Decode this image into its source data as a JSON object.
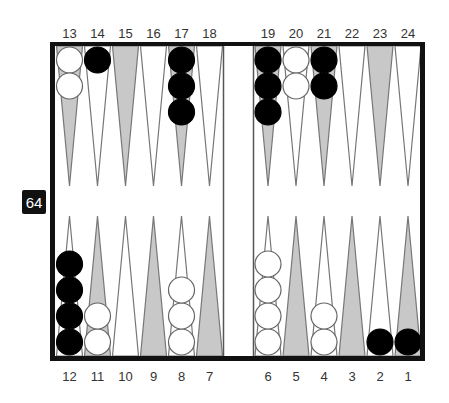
{
  "board": {
    "top_labels": [
      "13",
      "14",
      "15",
      "16",
      "17",
      "18",
      "19",
      "20",
      "21",
      "22",
      "23",
      "24"
    ],
    "bottom_labels": [
      "12",
      "11",
      "10",
      "9",
      "8",
      "7",
      "6",
      "5",
      "4",
      "3",
      "2",
      "1"
    ],
    "cube": {
      "value": "64",
      "position": "left-center"
    },
    "colors": {
      "frame": "#111111",
      "point_outline": "#777777",
      "shaded_point": "#c8c8c8",
      "light_point": "#ffffff",
      "black_checker": "#000000",
      "white_checker": "#ffffff",
      "cube_bg": "#111111"
    },
    "points": [
      {
        "point": 1,
        "color": "black",
        "count": 1
      },
      {
        "point": 2,
        "color": "black",
        "count": 1
      },
      {
        "point": 3,
        "color": null,
        "count": 0
      },
      {
        "point": 4,
        "color": "white",
        "count": 2
      },
      {
        "point": 5,
        "color": null,
        "count": 0
      },
      {
        "point": 6,
        "color": "white",
        "count": 4
      },
      {
        "point": 7,
        "color": null,
        "count": 0
      },
      {
        "point": 8,
        "color": "white",
        "count": 3
      },
      {
        "point": 9,
        "color": null,
        "count": 0
      },
      {
        "point": 10,
        "color": null,
        "count": 0
      },
      {
        "point": 11,
        "color": "white",
        "count": 2
      },
      {
        "point": 12,
        "color": "black",
        "count": 4
      },
      {
        "point": 13,
        "color": "white",
        "count": 2
      },
      {
        "point": 14,
        "color": "black",
        "count": 1
      },
      {
        "point": 15,
        "color": null,
        "count": 0
      },
      {
        "point": 16,
        "color": null,
        "count": 0
      },
      {
        "point": 17,
        "color": "black",
        "count": 3
      },
      {
        "point": 18,
        "color": null,
        "count": 0
      },
      {
        "point": 19,
        "color": "black",
        "count": 3
      },
      {
        "point": 20,
        "color": "white",
        "count": 2
      },
      {
        "point": 21,
        "color": "black",
        "count": 2
      },
      {
        "point": 22,
        "color": null,
        "count": 0
      },
      {
        "point": 23,
        "color": null,
        "count": 0
      },
      {
        "point": 24,
        "color": null,
        "count": 0
      }
    ]
  }
}
